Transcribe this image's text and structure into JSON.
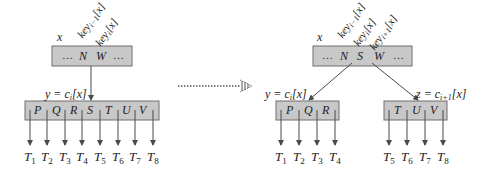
{
  "left": {
    "parent": {
      "name_label": "x",
      "keys": [
        "…",
        "N",
        "W",
        "…"
      ],
      "key_labels": [
        {
          "base": "key",
          "sub": "i−1",
          "suffix": "[x]"
        },
        {
          "base": "key",
          "sub": "i",
          "suffix": "[x]"
        }
      ]
    },
    "child": {
      "label": "y = c",
      "label_sub": "i",
      "label_suffix": "[x]",
      "keys": [
        "P",
        "Q",
        "R",
        "S",
        "T",
        "U",
        "V"
      ]
    },
    "subtrees": [
      {
        "base": "T",
        "sub": "1"
      },
      {
        "base": "T",
        "sub": "2"
      },
      {
        "base": "T",
        "sub": "3"
      },
      {
        "base": "T",
        "sub": "4"
      },
      {
        "base": "T",
        "sub": "5"
      },
      {
        "base": "T",
        "sub": "6"
      },
      {
        "base": "T",
        "sub": "7"
      },
      {
        "base": "T",
        "sub": "8"
      }
    ]
  },
  "transition": {
    "arrow": "dotted-arrow"
  },
  "right": {
    "parent": {
      "name_label": "x",
      "keys": [
        "…",
        "N",
        "S",
        "W",
        "…"
      ],
      "key_labels": [
        {
          "base": "key",
          "sub": "i−1",
          "suffix": "[x]"
        },
        {
          "base": "key",
          "sub": "i",
          "suffix": "[x]"
        },
        {
          "base": "key",
          "sub": "i+1",
          "suffix": "[x]"
        }
      ]
    },
    "left_child": {
      "label": "y = c",
      "label_sub": "i",
      "label_suffix": "[x]",
      "keys": [
        "P",
        "Q",
        "R"
      ],
      "subtrees": [
        {
          "base": "T",
          "sub": "1"
        },
        {
          "base": "T",
          "sub": "2"
        },
        {
          "base": "T",
          "sub": "3"
        },
        {
          "base": "T",
          "sub": "4"
        }
      ]
    },
    "right_child": {
      "label": "z = c",
      "label_sub": "i+1",
      "label_suffix": "[x]",
      "keys": [
        "T",
        "U",
        "V"
      ],
      "subtrees": [
        {
          "base": "T",
          "sub": "5"
        },
        {
          "base": "T",
          "sub": "6"
        },
        {
          "base": "T",
          "sub": "7"
        },
        {
          "base": "T",
          "sub": "8"
        }
      ]
    }
  },
  "colors": {
    "node_fill": "#c8c8c8",
    "node_stroke": "#6e6e6e",
    "line": "#4a4a4a"
  }
}
